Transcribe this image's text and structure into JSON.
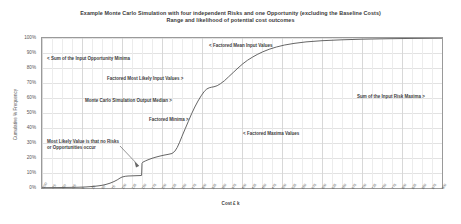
{
  "chart_data": {
    "type": "line",
    "title": "Example Monte Carlo Simulation with four independent Risks and one Opportunity (excluding the Baseline Costs)",
    "subtitle": "Range and likelihood of potential cost outcomes",
    "xlabel": "Cost £ k",
    "ylabel": "Cumulative % Frequency",
    "grid": true,
    "legend": "none",
    "xlim": [
      -100,
      900
    ],
    "ylim": [
      0,
      100
    ],
    "y_ticks": [
      "0%",
      "10%",
      "20%",
      "30%",
      "40%",
      "50%",
      "60%",
      "70%",
      "80%",
      "90%",
      "100%"
    ],
    "y_tick_values": [
      0,
      10,
      20,
      30,
      40,
      50,
      60,
      70,
      80,
      90,
      100
    ],
    "x_ticks": [
      "-100",
      "-75",
      "-50",
      "-25",
      "0",
      "25",
      "50",
      "75",
      "100",
      "125",
      "150",
      "175",
      "200",
      "225",
      "250",
      "275",
      "300",
      "325",
      "350",
      "375",
      "400",
      "425",
      "450",
      "475",
      "500",
      "525",
      "550",
      "575",
      "600",
      "625",
      "650",
      "675",
      "700",
      "725",
      "750",
      "775",
      "800",
      "825",
      "850",
      "875",
      "900"
    ],
    "series": [
      {
        "name": "Cumulative % Frequency",
        "color": "#555555",
        "x": [
          -100,
          -60,
          -30,
          -10,
          0,
          10,
          20,
          30,
          40,
          50,
          60,
          70,
          80,
          88,
          95,
          100,
          108,
          115,
          125,
          135,
          145,
          149,
          150,
          152,
          158,
          165,
          175,
          185,
          195,
          205,
          215,
          225,
          232,
          238,
          244,
          250,
          258,
          266,
          274,
          282,
          290,
          298,
          306,
          312,
          318,
          324,
          330,
          338,
          346,
          356,
          366,
          378,
          390,
          402,
          414,
          426,
          438,
          452,
          468,
          486,
          506,
          530,
          560,
          600,
          650,
          700,
          760,
          820,
          900
        ],
        "y": [
          0.2,
          0.3,
          0.4,
          0.5,
          0.6,
          0.7,
          0.9,
          1.1,
          1.4,
          1.8,
          2.4,
          3.2,
          4.3,
          5.4,
          6.6,
          7.3,
          7.8,
          8.0,
          8.1,
          8.2,
          8.3,
          8.4,
          16.5,
          17.2,
          18.0,
          18.8,
          19.8,
          20.6,
          21.3,
          21.9,
          22.4,
          23.0,
          24.5,
          27.0,
          30.5,
          34.5,
          39.5,
          44.5,
          49.5,
          54.0,
          58.0,
          61.5,
          64.5,
          66.0,
          66.8,
          67.2,
          67.5,
          68.2,
          69.5,
          71.5,
          74.0,
          77.0,
          80.0,
          82.8,
          85.2,
          87.2,
          89.0,
          90.8,
          92.5,
          94.0,
          95.3,
          96.4,
          97.4,
          98.2,
          98.8,
          99.2,
          99.5,
          99.7,
          99.9
        ]
      }
    ],
    "annotations": [
      {
        "id": "opportunity-minima",
        "text": "< Sum of the Input Opportunity Minima",
        "x_pct": 1.5,
        "y_pct": 12.5
      },
      {
        "id": "most-likely-input",
        "text": "Factored Most Likely Input Values >",
        "x_pct": 16.5,
        "y_pct": 26.0
      },
      {
        "id": "output-median",
        "text": "Monte Carlo Simulation Output Median >",
        "x_pct": 11.0,
        "y_pct": 40.5
      },
      {
        "id": "factored-minima",
        "text": "Factored Minima >",
        "x_pct": 27.0,
        "y_pct": 53.5
      },
      {
        "id": "factored-mean",
        "text": "< Factored Mean Input Values",
        "x_pct": 42.0,
        "y_pct": 4.0
      },
      {
        "id": "factored-maxima",
        "text": "< Factored Maxima Values",
        "x_pct": 50.5,
        "y_pct": 62.5
      },
      {
        "id": "risk-maxima",
        "text": "Sum of the Input Risk Maxima >",
        "x_pct": 79.0,
        "y_pct": 38.0
      }
    ],
    "callout": {
      "id": "most-likely-value",
      "line1": "Most Likely Value is that no",
      "line2": "Risks or Opportunities occur",
      "x_pct": 1.5,
      "y_pct": 68.0
    },
    "colors": {
      "curve": "#555555",
      "grid": "#e2e2e2",
      "frame": "#9a9a9a",
      "text": "#3d3d3d",
      "background": "#ffffff"
    }
  }
}
